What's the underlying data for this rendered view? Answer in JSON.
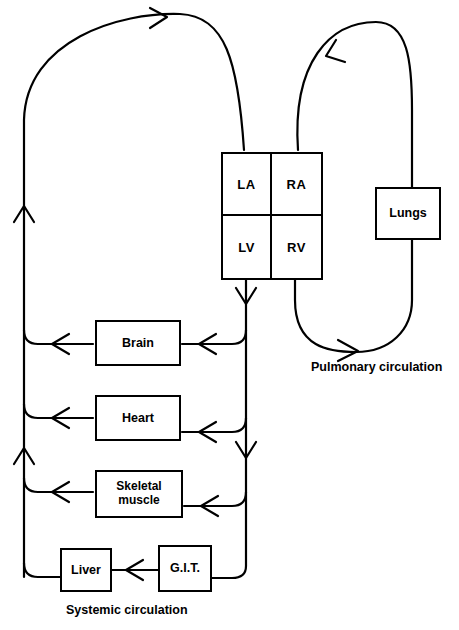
{
  "diagram": {
    "stroke_color": "#000000",
    "background_color": "#ffffff"
  },
  "heart": {
    "chambers": [
      {
        "id": "la",
        "label": "LA",
        "name": "left-atrium"
      },
      {
        "id": "ra",
        "label": "RA",
        "name": "right-atrium"
      },
      {
        "id": "lv",
        "label": "LV",
        "name": "left-ventricle"
      },
      {
        "id": "rv",
        "label": "RV",
        "name": "right-ventricle"
      }
    ]
  },
  "organs": {
    "lungs": {
      "label": "Lungs"
    },
    "brain": {
      "label": "Brain"
    },
    "heart_muscle": {
      "label": "Heart"
    },
    "skeletal_muscle": {
      "label_line1": "Skeletal",
      "label_line2": "muscle"
    },
    "liver": {
      "label": "Liver"
    },
    "git": {
      "label": "G.I.T."
    }
  },
  "captions": {
    "pulmonary": "Pulmonary  circulation",
    "systemic": "Systemic  circulation"
  },
  "flows": [
    {
      "name": "lv-to-systemic-arteries",
      "from": "LV",
      "to": "systemic organs"
    },
    {
      "name": "systemic-veins-to-ra",
      "from": "systemic organs",
      "to": "RA"
    },
    {
      "name": "rv-to-lungs",
      "from": "RV",
      "to": "Lungs"
    },
    {
      "name": "lungs-to-la",
      "from": "Lungs",
      "to": "LA"
    },
    {
      "name": "git-to-liver-portal",
      "from": "G.I.T.",
      "to": "Liver"
    }
  ]
}
